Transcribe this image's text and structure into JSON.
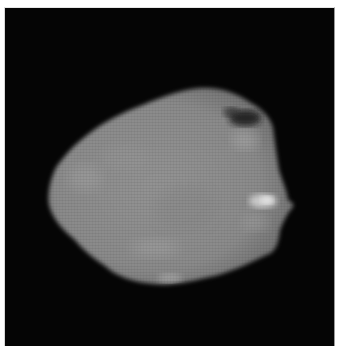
{
  "image": {
    "subject": "asteroid",
    "description": "Grayscale image of an irregular rocky body on a black background",
    "colors": {
      "background": "#050505",
      "body_mid": "#8e8e8e",
      "body_light": "#a8a8a8",
      "highlight": "#e0e0e0",
      "shadow": "#2a2a2a",
      "border": "#ffffff"
    }
  }
}
